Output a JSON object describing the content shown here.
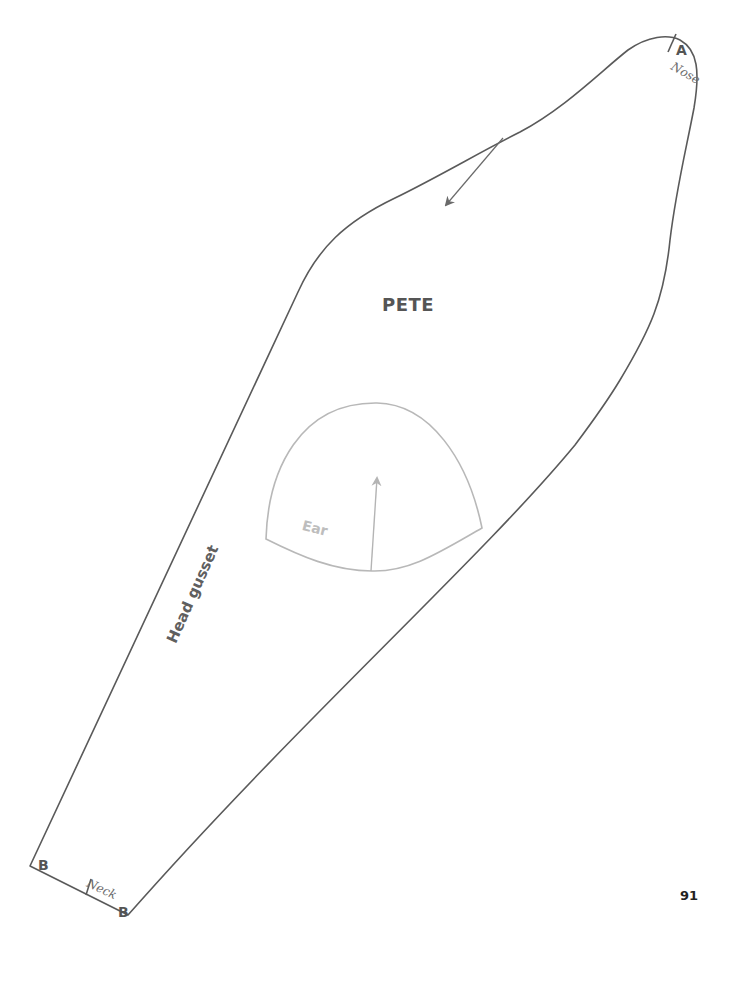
{
  "pattern": {
    "piece_name": "PETE",
    "gusset_label": "Head gusset",
    "ear_label": "Ear",
    "marks": {
      "a_letter": "A",
      "a_note": "Nose",
      "b_left_letter": "B",
      "b_right_letter": "B",
      "b_note": "Neck"
    },
    "colors": {
      "outline": "#5a5a5a",
      "ear_outline": "#b8b8b8",
      "text_dark": "#555555",
      "text_light": "#bdbdbd"
    }
  },
  "page": {
    "number": "91"
  }
}
